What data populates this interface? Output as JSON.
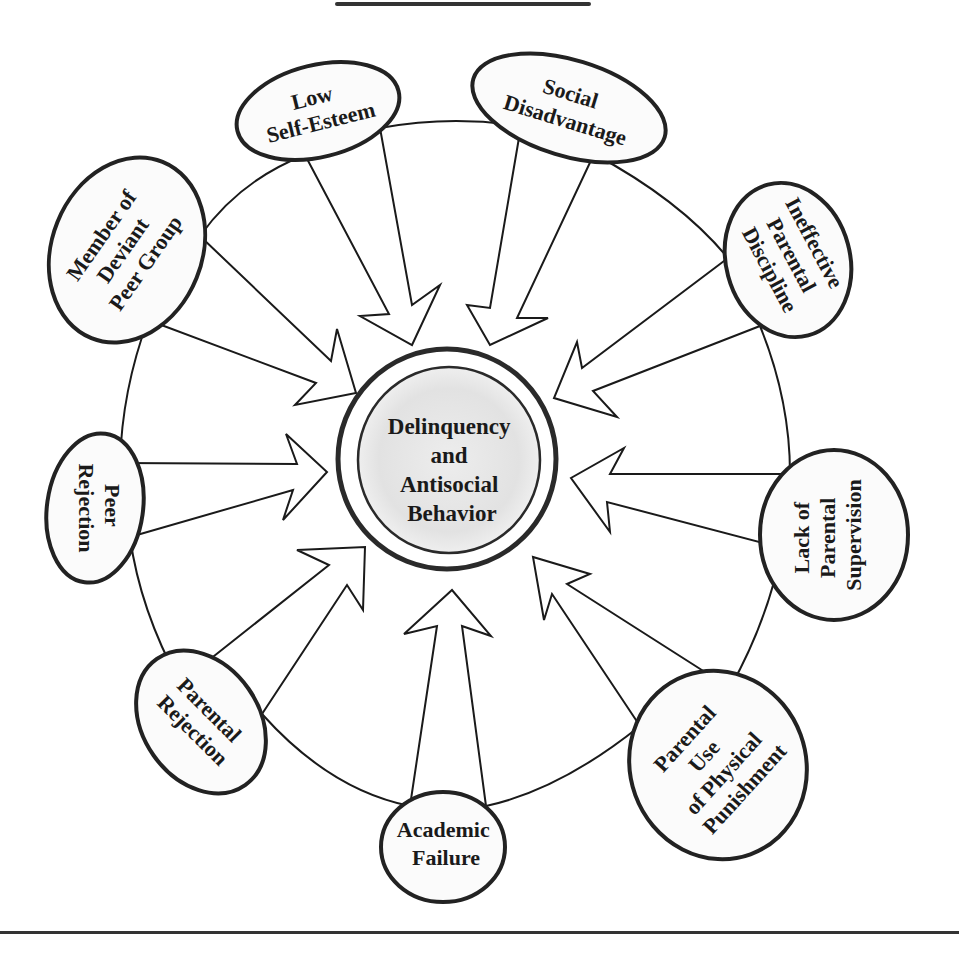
{
  "diagram": {
    "type": "radial-influence-diagram",
    "center": {
      "lines": [
        "Delinquency",
        "and",
        "Antisocial",
        "Behavior"
      ]
    },
    "factors": [
      {
        "id": "low-self-esteem",
        "lines": [
          "Low",
          "Self-Esteem"
        ]
      },
      {
        "id": "social-disadvantage",
        "lines": [
          "Social",
          "Disadvantage"
        ]
      },
      {
        "id": "ineffective-parental-discipline",
        "lines": [
          "Ineffective",
          "Parental",
          "Discipline"
        ]
      },
      {
        "id": "lack-of-parental-supervision",
        "lines": [
          "Lack of",
          "Parental",
          "Supervision"
        ]
      },
      {
        "id": "parental-use-of-physical-punishment",
        "lines": [
          "Parental",
          "Use",
          "of Physical",
          "Punishment"
        ]
      },
      {
        "id": "academic-failure",
        "lines": [
          "Academic",
          "Failure"
        ]
      },
      {
        "id": "parental-rejection",
        "lines": [
          "Parental",
          "Rejection"
        ]
      },
      {
        "id": "peer-rejection",
        "lines": [
          "Peer",
          "Rejection"
        ]
      },
      {
        "id": "member-of-deviant-peer-group",
        "lines": [
          "Member of",
          "Deviant",
          "Peer Group"
        ]
      }
    ],
    "colors": {
      "ink": "#1a1a1a",
      "center_fill": "#e4e4e4",
      "background": "#ffffff"
    }
  }
}
